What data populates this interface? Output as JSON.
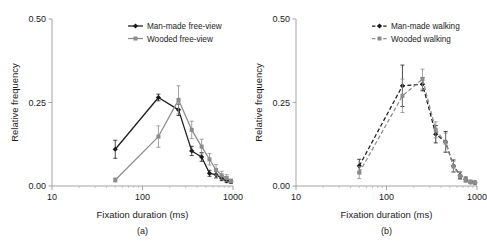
{
  "figure": {
    "panels": [
      {
        "caption": "(a)",
        "xlabel": "Fixation duration (ms)",
        "ylabel": "Relative frequency",
        "ytick_labels": [
          "0.00",
          "0.25",
          "0.50"
        ],
        "xtick_labels": [
          "10",
          "100",
          "1000"
        ],
        "legend": [
          {
            "label": "Man-made free-view",
            "color": "#1a1a1a",
            "dash": "solid",
            "marker": "diamond"
          },
          {
            "label": "Wooded free-view",
            "color": "#8c8c8c",
            "dash": "solid",
            "marker": "square"
          }
        ]
      },
      {
        "caption": "(b)",
        "xlabel": "Fixation duration (ms)",
        "ylabel": "Relative frequency",
        "ytick_labels": [
          "0.00",
          "0.25",
          "0.50"
        ],
        "xtick_labels": [
          "10",
          "100",
          "1000"
        ],
        "legend": [
          {
            "label": "Man-made walking",
            "color": "#1a1a1a",
            "dash": "dashed",
            "marker": "diamond"
          },
          {
            "label": "Wooded walking",
            "color": "#8c8c8c",
            "dash": "dashed",
            "marker": "square"
          }
        ]
      }
    ]
  },
  "chart_data": [
    {
      "type": "line",
      "title": "(a)",
      "xlabel": "Fixation duration (ms)",
      "ylabel": "Relative frequency",
      "xscale": "log",
      "xlim": [
        10,
        1000
      ],
      "ylim": [
        0.0,
        0.5
      ],
      "yticks": [
        0.0,
        0.25,
        0.5
      ],
      "xticks": [
        10,
        100,
        1000
      ],
      "grid": false,
      "legend_position": "top-right",
      "series": [
        {
          "name": "Man-made free-view",
          "color": "#1a1a1a",
          "linestyle": "solid",
          "marker": "diamond",
          "x": [
            50,
            150,
            250,
            350,
            450,
            550,
            650,
            750,
            850,
            950
          ],
          "y": [
            0.11,
            0.265,
            0.228,
            0.105,
            0.087,
            0.038,
            0.034,
            0.023,
            0.016,
            0.013
          ],
          "yerr": [
            0.027,
            0.01,
            0.017,
            0.014,
            0.013,
            0.009,
            0.01,
            0.007,
            0.006,
            0.005
          ]
        },
        {
          "name": "Wooded free-view",
          "color": "#8c8c8c",
          "linestyle": "solid",
          "marker": "square",
          "x": [
            50,
            150,
            250,
            350,
            450,
            550,
            650,
            750,
            850,
            950
          ],
          "y": [
            0.018,
            0.148,
            0.258,
            0.168,
            0.118,
            0.08,
            0.048,
            0.032,
            0.024,
            0.015
          ],
          "yerr": [
            0.006,
            0.032,
            0.042,
            0.026,
            0.022,
            0.017,
            0.016,
            0.012,
            0.01,
            0.006
          ]
        }
      ]
    },
    {
      "type": "line",
      "title": "(b)",
      "xlabel": "Fixation duration (ms)",
      "ylabel": "Relative frequency",
      "xscale": "log",
      "xlim": [
        10,
        1000
      ],
      "ylim": [
        0.0,
        0.5
      ],
      "yticks": [
        0.0,
        0.25,
        0.5
      ],
      "xticks": [
        10,
        100,
        1000
      ],
      "grid": false,
      "legend_position": "top-right",
      "series": [
        {
          "name": "Man-made walking",
          "color": "#1a1a1a",
          "linestyle": "dashed",
          "marker": "diamond",
          "x": [
            50,
            150,
            250,
            350,
            450,
            550,
            650,
            750,
            850,
            950
          ],
          "y": [
            0.06,
            0.3,
            0.305,
            0.155,
            0.132,
            0.06,
            0.032,
            0.02,
            0.012,
            0.01
          ],
          "yerr": [
            0.02,
            0.062,
            0.02,
            0.026,
            0.031,
            0.018,
            0.01,
            0.007,
            0.005,
            0.004
          ]
        },
        {
          "name": "Wooded walking",
          "color": "#8c8c8c",
          "linestyle": "dashed",
          "marker": "square",
          "x": [
            50,
            150,
            250,
            350,
            450,
            550,
            650,
            750,
            850,
            950
          ],
          "y": [
            0.04,
            0.27,
            0.32,
            0.168,
            0.13,
            0.058,
            0.03,
            0.018,
            0.012,
            0.01
          ],
          "yerr": [
            0.018,
            0.05,
            0.03,
            0.024,
            0.028,
            0.016,
            0.01,
            0.007,
            0.005,
            0.004
          ]
        }
      ]
    }
  ]
}
